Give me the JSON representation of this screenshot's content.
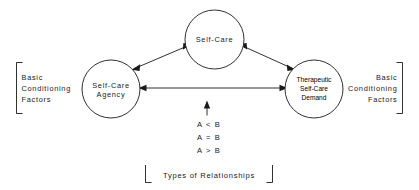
{
  "diagram": {
    "background_color": "#ffffff",
    "line_color": "#1a1a1a",
    "nodes": {
      "top": {
        "name": "self-care",
        "lines": [
          "Self-Care"
        ]
      },
      "left": {
        "name": "self-care-agency",
        "lines": [
          "Self-Care",
          "Agency"
        ]
      },
      "right": {
        "name": "therapeutic-self-care-demand",
        "lines": [
          "Therapeutic",
          "Self-Care",
          "Demand"
        ]
      }
    },
    "brackets": {
      "left": {
        "lines": [
          "Basic",
          "Conditioning",
          "Factors"
        ]
      },
      "right": {
        "lines": [
          "Basic",
          "Conditioning",
          "Factors"
        ]
      }
    },
    "relations": {
      "arrow_hint": "up-arrow",
      "lines": [
        "A < B",
        "A = B",
        "A > B"
      ]
    },
    "caption": {
      "text": "Types of Relationships"
    },
    "connectors": [
      {
        "name": "agency-to-self-care",
        "style": "double-headed"
      },
      {
        "name": "demand-to-self-care",
        "style": "double-headed"
      },
      {
        "name": "agency-to-demand",
        "style": "double-headed"
      }
    ]
  }
}
